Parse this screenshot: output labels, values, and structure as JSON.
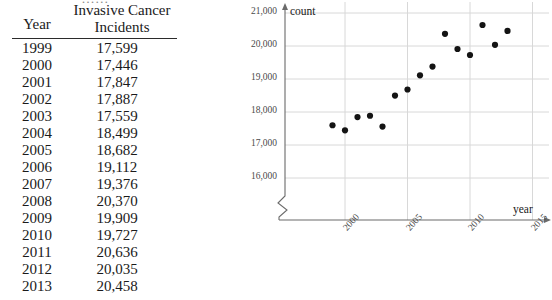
{
  "table": {
    "clipped_title_fragment": "……",
    "headers": {
      "year": "Year",
      "incidents_line1": "Invasive Cancer",
      "incidents_line2": "Incidents"
    },
    "rows": [
      {
        "year": "1999",
        "value": "17,599"
      },
      {
        "year": "2000",
        "value": "17,446"
      },
      {
        "year": "2001",
        "value": "17,847"
      },
      {
        "year": "2002",
        "value": "17,887"
      },
      {
        "year": "2003",
        "value": "17,559"
      },
      {
        "year": "2004",
        "value": "18,499"
      },
      {
        "year": "2005",
        "value": "18,682"
      },
      {
        "year": "2006",
        "value": "19,112"
      },
      {
        "year": "2007",
        "value": "19,376"
      },
      {
        "year": "2008",
        "value": "20,370"
      },
      {
        "year": "2009",
        "value": "19,909"
      },
      {
        "year": "2010",
        "value": "19,727"
      },
      {
        "year": "2011",
        "value": "20,636"
      },
      {
        "year": "2012",
        "value": "20,035"
      },
      {
        "year": "2013",
        "value": "20,458"
      }
    ]
  },
  "chart_axis_titles": {
    "y": "count",
    "x": "year"
  },
  "chart_data": {
    "type": "scatter",
    "title": "",
    "xlabel": "year",
    "ylabel": "count",
    "x": [
      1999,
      2000,
      2001,
      2002,
      2003,
      2004,
      2005,
      2006,
      2007,
      2008,
      2009,
      2010,
      2011,
      2012,
      2013
    ],
    "values": [
      17599,
      17446,
      17847,
      17887,
      17559,
      18499,
      18682,
      19112,
      19376,
      20370,
      19909,
      19727,
      20636,
      20035,
      20458
    ],
    "xlim": [
      1998.6,
      2015.4
    ],
    "ylim": [
      15600,
      21000
    ],
    "xticks": [
      "2000",
      "2005",
      "2010",
      "2015"
    ],
    "xtick_values": [
      2000,
      2005,
      2010,
      2015
    ],
    "yticks": [
      "16,000",
      "17,000",
      "18,000",
      "19,000",
      "20,000",
      "21,000"
    ],
    "ytick_values": [
      16000,
      17000,
      18000,
      19000,
      20000,
      21000
    ],
    "grid": true,
    "legend": "none",
    "y_axis_break": true,
    "marker_color": "#141414",
    "grid_color": "#d8d8d8",
    "axis_color": "#6b6b6b"
  }
}
